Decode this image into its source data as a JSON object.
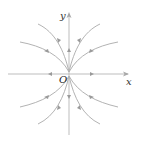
{
  "diagram": {
    "type": "phase-portrait",
    "labels": {
      "x_axis": "x",
      "y_axis": "y",
      "origin": "O"
    },
    "colors": {
      "background": "#ffffff",
      "curve": "#b0b0b0",
      "axis": "#b8b8b8",
      "arrow": "#9a9a9a",
      "text": "#333333"
    },
    "flow_direction": "outward",
    "trajectory_count": 8
  }
}
